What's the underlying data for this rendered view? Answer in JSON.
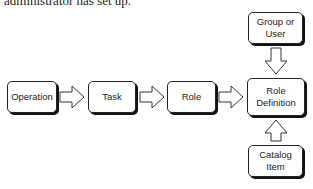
{
  "caption": "administrator has set up.",
  "nodes": {
    "operation": "Operation",
    "task": "Task",
    "role": "Role",
    "role_definition": "Role Definition",
    "group_or_user": "Group or User",
    "catalog_item": "Catalog Item"
  },
  "edges": [
    {
      "from": "Operation",
      "to": "Task"
    },
    {
      "from": "Task",
      "to": "Role"
    },
    {
      "from": "Role",
      "to": "Role Definition"
    },
    {
      "from": "Group or User",
      "to": "Role Definition"
    },
    {
      "from": "Catalog Item",
      "to": "Role Definition"
    }
  ]
}
